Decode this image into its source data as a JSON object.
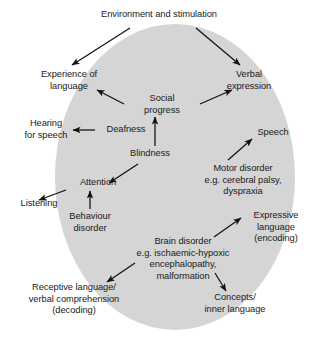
{
  "figure": {
    "background_color": "#ffffff",
    "ellipse_color": "#d5d5d5",
    "text_color": "#1a1a1a",
    "arrow_color": "#111111"
  },
  "nodes": {
    "environment": "Environment and stimulation",
    "experience": "Experience of\nlanguage",
    "verbal": "Verbal\nexpression",
    "social": "Social\nprogress",
    "hearing": "Hearing\nfor speech",
    "deafness": "Deafness",
    "speech": "Speech",
    "blindness": "Blindness",
    "motor": "Motor disorder\ne.g. cerebral palsy,\ndyspraxia",
    "attention": "Attention",
    "listening": "Listening",
    "behaviour": "Behaviour\ndisorder",
    "expressive": "Expressive\nlanguage\n(encoding)",
    "brain": "Brain disorder\ne.g. ischaemic-hypoxic\nencephalopathy,\nmalformation",
    "receptive": "Receptive language/\nverbal comprehension\n(decoding)",
    "concepts": "Concepts/\ninner language"
  },
  "edges": [
    {
      "from": "environment",
      "to": "experience"
    },
    {
      "from": "environment",
      "to": "verbal"
    },
    {
      "from": "social",
      "to": "experience"
    },
    {
      "from": "social",
      "to": "verbal"
    },
    {
      "from": "blindness",
      "to": "social"
    },
    {
      "from": "deafness",
      "to": "hearing"
    },
    {
      "from": "blindness",
      "to": "attention"
    },
    {
      "from": "attention",
      "to": "listening"
    },
    {
      "from": "behaviour",
      "to": "attention"
    },
    {
      "from": "motor",
      "to": "speech"
    },
    {
      "from": "brain",
      "to": "expressive"
    },
    {
      "from": "brain",
      "to": "receptive"
    },
    {
      "from": "brain",
      "to": "concepts"
    }
  ]
}
